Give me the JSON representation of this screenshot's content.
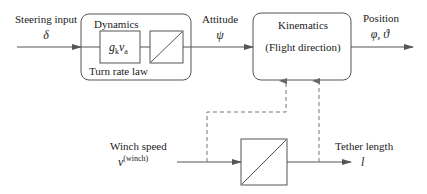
{
  "diagram": {
    "inputs": {
      "steering": {
        "label": "Steering input",
        "symbol": "δ"
      },
      "winch": {
        "label": "Winch speed",
        "symbol": "v",
        "superscript": "(winch)"
      }
    },
    "blocks": {
      "dynamics": {
        "title": "Dynamics",
        "footer": "Turn rate law",
        "gain": {
          "g": "g",
          "g_sub": "k",
          "v": "v",
          "v_sub": "a"
        }
      },
      "kinematics": {
        "title": "Kinematics",
        "subtitle": "(Flight direction)"
      },
      "integrator_bottom": {
        "type": "integrator"
      }
    },
    "signals": {
      "attitude": {
        "label": "Attitude",
        "symbol": "ψ"
      },
      "position": {
        "label": "Position",
        "symbol": "φ, ϑ"
      },
      "tether": {
        "label": "Tether length",
        "symbol": "l"
      }
    },
    "colors": {
      "line": "#555555",
      "dashed": "#777777",
      "text": "#222222"
    }
  }
}
